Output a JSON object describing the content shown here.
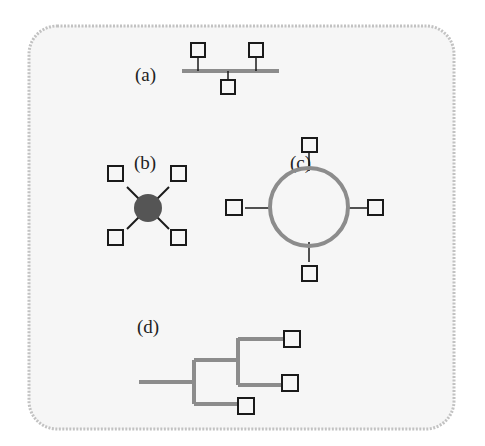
{
  "figure": {
    "background_color": "#f7f7f7",
    "border_color": "#bdbdbd",
    "line_color": "#8c8c8c",
    "node_color": "#1a1a1a",
    "hub_color": "#555555"
  },
  "panels": [
    {
      "id": "a",
      "label": "(a)",
      "topology": "bus"
    },
    {
      "id": "b",
      "label": "(b)",
      "topology": "star"
    },
    {
      "id": "c",
      "label": "(c)",
      "topology": "ring"
    },
    {
      "id": "d",
      "label": "(d)",
      "topology": "tree"
    }
  ]
}
